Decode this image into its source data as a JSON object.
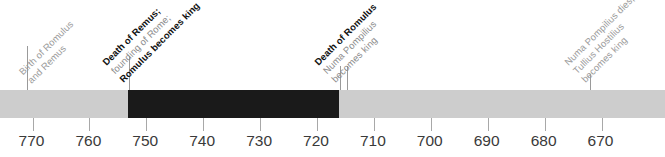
{
  "chart_data": {
    "type": "timeline",
    "title": "",
    "xlabel": "",
    "ylabel": "",
    "axis": {
      "direction": "decreasing-bce",
      "xlim": [
        776,
        664
      ],
      "grid": false,
      "tick_labels": [
        "770",
        "760",
        "750",
        "740",
        "730",
        "720",
        "710",
        "700",
        "690",
        "680",
        "670"
      ],
      "tick_values": [
        770,
        760,
        750,
        740,
        730,
        720,
        710,
        700,
        690,
        680,
        670
      ]
    },
    "segments": [
      {
        "name": "pre-founding",
        "start": 776,
        "end": 753,
        "color": "#cdcdcd"
      },
      {
        "name": "reign-of-romulus",
        "start": 753,
        "end": 716,
        "color": "#1a1a1a"
      },
      {
        "name": "reign-of-numa-pompilius",
        "start": 716,
        "end": 664,
        "color": "#cdcdcd"
      }
    ],
    "events": [
      {
        "id": "birth-of-romulus-and-remus",
        "value": 771,
        "style": "gray",
        "lines": [
          {
            "text": "Birth of Romulus",
            "bold": false
          },
          {
            "text": "and Remus",
            "bold": false
          }
        ]
      },
      {
        "id": "death-of-remus-founding-of-rome",
        "value": 753,
        "style": "mixed",
        "lines": [
          {
            "text": "Death of Remus;",
            "bold": true
          },
          {
            "text": "founding of Rome;",
            "bold": false
          },
          {
            "text": "Romulus becomes king",
            "bold": true
          }
        ]
      },
      {
        "id": "death-of-romulus",
        "value": 716,
        "style": "mixed",
        "lines": [
          {
            "text": "Death of Romulus",
            "bold": true
          },
          {
            "text": "Numa Pompilius",
            "bold": false
          },
          {
            "text": "becomes king",
            "bold": false
          }
        ]
      },
      {
        "id": "numa-pompilius-dies",
        "value": 672,
        "style": "gray",
        "lines": [
          {
            "text": "Numa Pompilius dies;",
            "bold": false
          },
          {
            "text": "Tullius Hostilius",
            "bold": false
          },
          {
            "text": "becomes king",
            "bold": false
          }
        ]
      }
    ],
    "colors": {
      "band_light": "#cdcdcd",
      "band_dark": "#1a1a1a",
      "leader": "#9a9a9a",
      "tick": "#a8a8a8",
      "tick_label_text": "#3a3a3a",
      "event_text_bold": "#111111",
      "event_text_plain": "#8c8c8c",
      "event_text_gray": "#9b9b9b",
      "background": "#ffffff"
    }
  }
}
